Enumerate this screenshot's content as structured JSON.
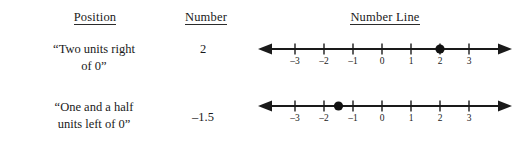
{
  "headers": {
    "position": "Position",
    "number": "Number",
    "number_line": "Number Line"
  },
  "rows": [
    {
      "position_line1": "“Two units right",
      "position_line2": "of 0”",
      "number": "2",
      "number_line": {
        "point_value": 2,
        "point_style": "filled-dot",
        "tick_labels": [
          "–3",
          "–2",
          "–1",
          "0",
          "1",
          "2",
          "3"
        ],
        "tick_values": [
          -3,
          -2,
          -1,
          0,
          1,
          2,
          3
        ],
        "arrow_left": true,
        "arrow_right": true
      }
    },
    {
      "position_line1": "“One and a half",
      "position_line2": "units left of 0”",
      "number": "–1.5",
      "number_line": {
        "point_value": -1.5,
        "point_style": "filled-dot",
        "tick_labels": [
          "–3",
          "–2",
          "–1",
          "0",
          "1",
          "2",
          "3"
        ],
        "tick_values": [
          -3,
          -2,
          -1,
          0,
          1,
          2,
          3
        ],
        "arrow_left": true,
        "arrow_right": true
      }
    }
  ],
  "colors": {
    "ink": "#1a1a1a",
    "background": "#ffffff"
  }
}
